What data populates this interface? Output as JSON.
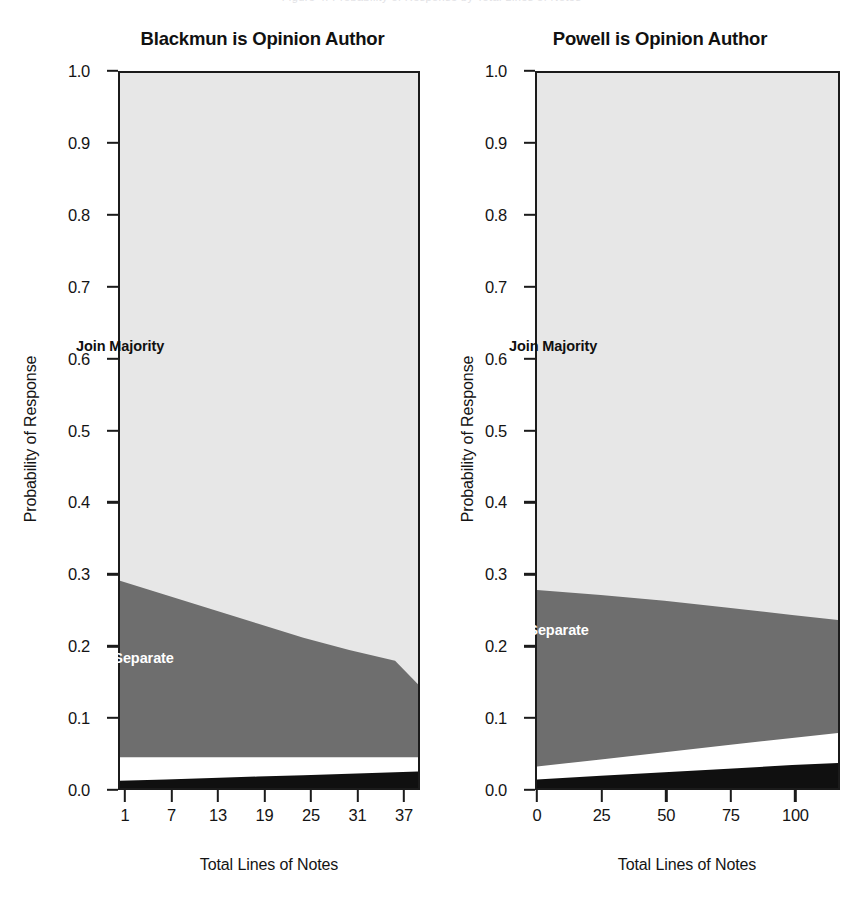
{
  "figure": {
    "top_clipped_caption": "Figure 4.   Probability of Response by Total Lines of Notes",
    "background_color": "#ffffff",
    "axis_color": "#1b1b1b"
  },
  "legend_bands": {
    "majority_label": "Join Majority",
    "separate_label": "Join Separate",
    "majority_color": "#e7e7e7",
    "separate_color": "#6e6e6e",
    "white_band_color": "#ffffff",
    "black_band_color": "#101010"
  },
  "axes": {
    "y_title": "Probability of Response",
    "x_title": "Total Lines of Notes",
    "y_ticks": [
      "1.0",
      "0.9",
      "0.8",
      "0.7",
      "0.6",
      "0.5",
      "0.4",
      "0.3",
      "0.2",
      "0.1",
      "0.0"
    ],
    "y_tick_values": [
      1.0,
      0.9,
      0.8,
      0.7,
      0.6,
      0.5,
      0.4,
      0.3,
      0.2,
      0.1,
      0.0
    ],
    "ylim": [
      0.0,
      1.0
    ]
  },
  "chart_data": [
    {
      "type": "area",
      "title": "Blackmun is Opinion Author",
      "xlabel": "Total Lines of Notes",
      "ylabel": "Probability of Response",
      "xlim": [
        1,
        40
      ],
      "ylim": [
        0,
        1
      ],
      "x_ticks": [
        1,
        7,
        13,
        19,
        25,
        31,
        37
      ],
      "x_tick_labels": [
        "1",
        "7",
        "13",
        "19",
        "25",
        "31",
        "37"
      ],
      "y_ticks": [
        0.0,
        0.1,
        0.2,
        0.3,
        0.4,
        0.5,
        0.6,
        0.7,
        0.8,
        0.9,
        1.0
      ],
      "stacked": true,
      "grid": false,
      "legend": "in-plot annotations",
      "x": [
        1,
        7,
        13,
        19,
        25,
        31,
        37,
        40
      ],
      "series": [
        {
          "name": "Other (black band)",
          "color": "#101010",
          "values": [
            0.01,
            0.012,
            0.014,
            0.016,
            0.018,
            0.02,
            0.022,
            0.023
          ]
        },
        {
          "name": "Unlabeled (white band)",
          "color": "#ffffff",
          "values": [
            0.033,
            0.031,
            0.029,
            0.027,
            0.025,
            0.023,
            0.021,
            0.02
          ]
        },
        {
          "name": "Join Separate",
          "color": "#6e6e6e",
          "values": [
            0.247,
            0.227,
            0.207,
            0.187,
            0.167,
            0.15,
            0.135,
            0.102
          ]
        },
        {
          "name": "Join Majority",
          "color": "#e7e7e7",
          "values": [
            0.71,
            0.73,
            0.75,
            0.77,
            0.79,
            0.807,
            0.822,
            0.855
          ]
        }
      ],
      "cumulative_boundaries": {
        "black_top": [
          0.01,
          0.012,
          0.014,
          0.016,
          0.018,
          0.02,
          0.022,
          0.023
        ],
        "white_top": [
          0.043,
          0.043,
          0.043,
          0.043,
          0.043,
          0.043,
          0.043,
          0.043
        ],
        "separate_top": [
          0.29,
          0.27,
          0.25,
          0.23,
          0.21,
          0.193,
          0.178,
          0.145
        ],
        "majority_top": [
          1.0,
          1.0,
          1.0,
          1.0,
          1.0,
          1.0,
          1.0,
          1.0
        ]
      }
    },
    {
      "type": "area",
      "title": "Powell is Opinion Author",
      "xlabel": "Total Lines of Notes",
      "ylabel": "Probability of Response",
      "xlim": [
        0,
        118
      ],
      "ylim": [
        0,
        1
      ],
      "x_ticks": [
        0,
        25,
        50,
        75,
        100
      ],
      "x_tick_labels": [
        "0",
        "25",
        "50",
        "75",
        "100"
      ],
      "y_ticks": [
        0.0,
        0.1,
        0.2,
        0.3,
        0.4,
        0.5,
        0.6,
        0.7,
        0.8,
        0.9,
        1.0
      ],
      "stacked": true,
      "grid": false,
      "legend": "in-plot annotations",
      "x": [
        0,
        25,
        50,
        75,
        100,
        118
      ],
      "series": [
        {
          "name": "Other (black band)",
          "color": "#101010",
          "values": [
            0.012,
            0.017,
            0.022,
            0.027,
            0.032,
            0.035
          ]
        },
        {
          "name": "Unlabeled (white band)",
          "color": "#ffffff",
          "values": [
            0.018,
            0.023,
            0.028,
            0.033,
            0.038,
            0.042
          ]
        },
        {
          "name": "Join Separate",
          "color": "#6e6e6e",
          "values": [
            0.247,
            0.23,
            0.212,
            0.192,
            0.172,
            0.158
          ]
        },
        {
          "name": "Join Majority",
          "color": "#e7e7e7",
          "values": [
            0.723,
            0.73,
            0.738,
            0.748,
            0.758,
            0.765
          ]
        }
      ],
      "cumulative_boundaries": {
        "black_top": [
          0.012,
          0.017,
          0.022,
          0.027,
          0.032,
          0.035
        ],
        "white_top": [
          0.03,
          0.04,
          0.05,
          0.06,
          0.07,
          0.077
        ],
        "separate_top": [
          0.277,
          0.27,
          0.262,
          0.252,
          0.242,
          0.235
        ],
        "majority_top": [
          1.0,
          1.0,
          1.0,
          1.0,
          1.0,
          1.0
        ]
      }
    }
  ]
}
